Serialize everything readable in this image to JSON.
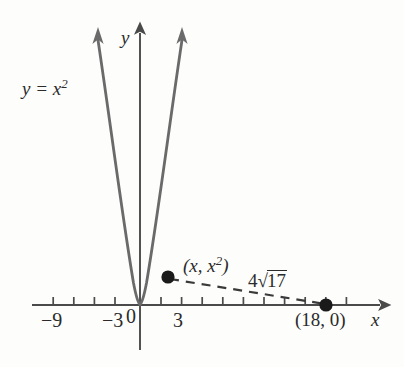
{
  "figure": {
    "background_color": "#fdfdfc",
    "ink_color": "#4a4a4a",
    "text_color": "#2b2b2b"
  },
  "axes": {
    "x_axis_label": "x",
    "y_axis_label": "y",
    "origin_label": "0",
    "x_tick_labels": [
      "−9",
      "−3",
      "3"
    ],
    "x_tick_values": [
      -9,
      -3,
      3
    ],
    "x_ticks_all": [
      -12,
      -10.5,
      -9,
      -7.5,
      -6,
      -4.5,
      -3,
      -1.5,
      1.5,
      3,
      4.5,
      6,
      7.5,
      9,
      10.5,
      12,
      13.5,
      15,
      16.5,
      18,
      19.5
    ],
    "x_range": [
      -13.5,
      21
    ],
    "y_range": [
      -4.5,
      19.5
    ]
  },
  "curve": {
    "label": "y = x",
    "label_exponent": "2",
    "equation": "y = x^2",
    "type": "parabola"
  },
  "points": [
    {
      "name": "tangency-point",
      "label_prefix": "(x, x",
      "label_exponent": "2",
      "label_suffix": ")",
      "label_text": "(x, x²)",
      "x": 2,
      "y": 4
    },
    {
      "name": "x-intercept-point",
      "label_text": "(18, 0)",
      "x": 18,
      "y": 0
    }
  ],
  "segment": {
    "name": "distance-segment",
    "style": "dashed",
    "length_coefficient": "4",
    "length_radicand": "17",
    "length_text": "4 √17"
  }
}
